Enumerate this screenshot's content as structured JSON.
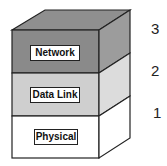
{
  "diagram": {
    "layers": [
      {
        "label": "Network",
        "number": "3",
        "front_color": "#8a8a8a",
        "side_color": "#9c9c9c"
      },
      {
        "label": "Data Link",
        "number": "2",
        "front_color": "#cfcfcf",
        "side_color": "#dcdcdc"
      },
      {
        "label": "Physical",
        "number": "1",
        "front_color": "#ffffff",
        "side_color": "#ffffff"
      }
    ],
    "top_color": "#8f8f8f"
  }
}
